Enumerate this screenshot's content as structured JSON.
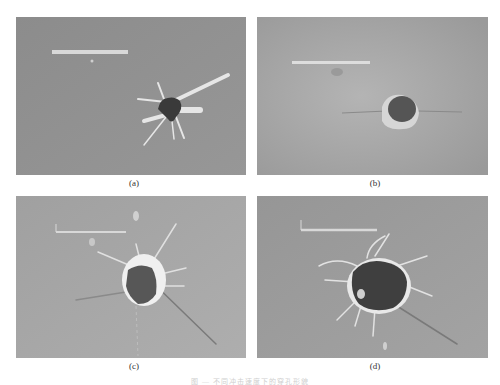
{
  "figure": {
    "panels": [
      {
        "id": "a",
        "label": "(a)",
        "description": "impact hole with radial spall petals, small irregular dark hole",
        "background": "#8f8f8f"
      },
      {
        "id": "b",
        "label": "(b)",
        "description": "small round dark hole with crack lines extending horizontally",
        "background": "#a9a9a9"
      },
      {
        "id": "c",
        "label": "(c)",
        "description": "larger hole with bright raised rim and radial cracks",
        "background": "#a4a4a4"
      },
      {
        "id": "d",
        "label": "(d)",
        "description": "largest irregular dark hole with bright rim and many radial cracks",
        "background": "#9a9a9a"
      }
    ],
    "caption": "图 — 不同冲击速度下的穿孔形貌"
  }
}
